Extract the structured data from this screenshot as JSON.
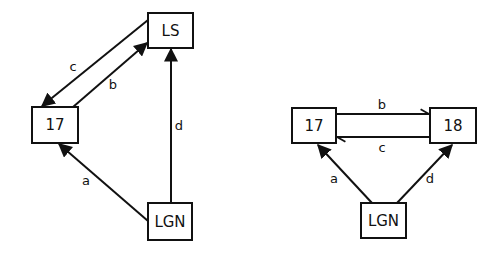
{
  "diagrams": [
    {
      "name": "left-diagram",
      "nodes": [
        {
          "id": "LS",
          "label": "LS"
        },
        {
          "id": "17",
          "label": "17"
        },
        {
          "id": "LGN",
          "label": "LGN"
        }
      ],
      "edges": [
        {
          "label": "c",
          "from": "LS",
          "to": "17"
        },
        {
          "label": "b",
          "from": "17",
          "to": "LS"
        },
        {
          "label": "d",
          "from": "LGN",
          "to": "LS"
        },
        {
          "label": "a",
          "from": "LGN",
          "to": "17"
        }
      ]
    },
    {
      "name": "right-diagram",
      "nodes": [
        {
          "id": "17",
          "label": "17"
        },
        {
          "id": "18",
          "label": "18"
        },
        {
          "id": "LGN",
          "label": "LGN"
        }
      ],
      "edges": [
        {
          "label": "b",
          "from": "17",
          "to": "18"
        },
        {
          "label": "c",
          "from": "18",
          "to": "17"
        },
        {
          "label": "a",
          "from": "LGN",
          "to": "17"
        },
        {
          "label": "d",
          "from": "LGN",
          "to": "18"
        }
      ]
    }
  ],
  "colors": {
    "stroke": "#111111",
    "background": "#ffffff"
  }
}
